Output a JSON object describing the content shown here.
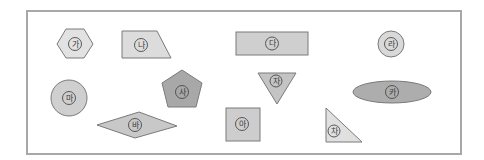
{
  "figure": {
    "frame": {
      "border_color": "#a8a8a8",
      "background": "#ffffff"
    },
    "shapes": [
      {
        "id": "ga",
        "label": "가",
        "type": "hexagon",
        "fill": "#e2e2e2"
      },
      {
        "id": "na",
        "label": "나",
        "type": "trapezoid",
        "fill": "#dcdcdc"
      },
      {
        "id": "da",
        "label": "다",
        "type": "rectangle",
        "fill": "#cfcfcf"
      },
      {
        "id": "ra",
        "label": "라",
        "type": "circle",
        "fill": "#d9d9d9"
      },
      {
        "id": "ma",
        "label": "마",
        "type": "circle",
        "fill": "#cfcfcf"
      },
      {
        "id": "ba",
        "label": "바",
        "type": "rhombus",
        "fill": "#c8c8c8"
      },
      {
        "id": "sa",
        "label": "사",
        "type": "pentagon",
        "fill": "#a8a8a8"
      },
      {
        "id": "a",
        "label": "아",
        "type": "square",
        "fill": "#cdcdcd"
      },
      {
        "id": "ja",
        "label": "자",
        "type": "inverted-triangle",
        "fill": "#c4c4c4"
      },
      {
        "id": "cha",
        "label": "차",
        "type": "right-triangle",
        "fill": "#e0e0e0"
      },
      {
        "id": "ka",
        "label": "카",
        "type": "ellipse",
        "fill": "#adadad"
      }
    ]
  }
}
